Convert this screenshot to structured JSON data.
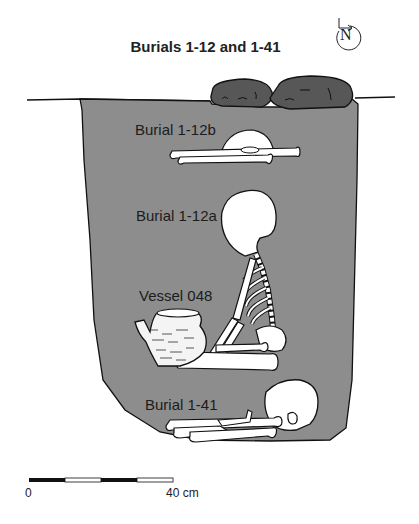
{
  "title": "Burials 1-12 and 1-41",
  "north_arrow": {
    "label": "N"
  },
  "labels": {
    "burial_1_12b": "Burial 1-12b",
    "burial_1_12a": "Burial 1-12a",
    "vessel": "Vessel 048",
    "burial_1_41": "Burial 1-41"
  },
  "scale_bar": {
    "start_label": "0",
    "end_label": "40 cm",
    "segments": 4
  },
  "colors": {
    "pit_fill": "#8c8c8c",
    "rock_fill": "#555555",
    "bone_fill": "#ffffff",
    "outline": "#111111"
  }
}
